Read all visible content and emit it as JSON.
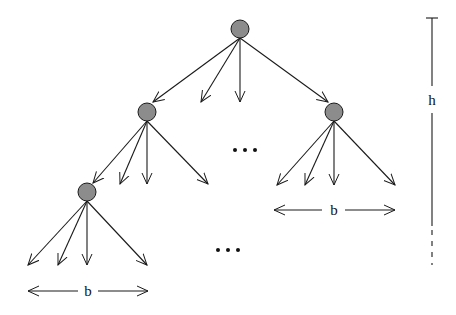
{
  "diagram": {
    "type": "tree",
    "colors": {
      "node_fill": "#8c8c8c",
      "stroke": "#1a1a1a",
      "background": "#ffffff"
    },
    "nodes": [
      {
        "id": "root",
        "x": 240,
        "y": 29
      },
      {
        "id": "l1-left",
        "x": 147,
        "y": 112
      },
      {
        "id": "l1-right",
        "x": 334,
        "y": 112
      },
      {
        "id": "l2-left",
        "x": 87,
        "y": 192
      }
    ],
    "labels": {
      "branching_top": "b",
      "branching_bottom": "b",
      "height": "h",
      "ellipsis_middle": "•••",
      "ellipsis_bottom": "•••"
    }
  }
}
